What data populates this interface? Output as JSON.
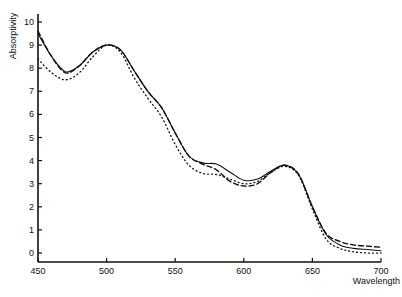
{
  "chart_data": {
    "type": "line",
    "title": "",
    "xlabel": "Wavelength",
    "ylabel": "Absorptivity",
    "xlim": [
      450,
      700
    ],
    "ylim": [
      0,
      10
    ],
    "grid": false,
    "legend": null,
    "x_ticks": [
      450,
      500,
      550,
      600,
      650,
      700
    ],
    "y_ticks": [
      0,
      1,
      2,
      3,
      4,
      5,
      6,
      7,
      8,
      9,
      10
    ],
    "x": [
      450,
      460,
      470,
      480,
      490,
      500,
      510,
      520,
      530,
      540,
      550,
      560,
      570,
      580,
      590,
      600,
      610,
      620,
      630,
      640,
      650,
      660,
      670,
      680,
      690,
      700
    ],
    "series": [
      {
        "name": "solid",
        "style": "solid",
        "values": [
          9.5,
          8.5,
          7.85,
          8.1,
          8.7,
          9.0,
          8.8,
          7.9,
          7.0,
          6.3,
          5.2,
          4.2,
          3.9,
          3.85,
          3.5,
          3.15,
          3.2,
          3.55,
          3.8,
          3.4,
          2.0,
          0.8,
          0.35,
          0.2,
          0.15,
          0.1
        ]
      },
      {
        "name": "dashed",
        "style": "dashed",
        "values": [
          9.6,
          8.5,
          7.8,
          8.1,
          8.7,
          9.0,
          8.8,
          7.9,
          7.0,
          6.3,
          5.2,
          4.2,
          3.85,
          3.6,
          3.1,
          2.9,
          3.0,
          3.5,
          3.8,
          3.4,
          2.0,
          0.85,
          0.5,
          0.35,
          0.3,
          0.25
        ]
      },
      {
        "name": "dotted",
        "style": "dotted",
        "values": [
          8.4,
          7.8,
          7.5,
          7.8,
          8.5,
          9.0,
          8.7,
          7.6,
          6.7,
          5.9,
          4.7,
          3.8,
          3.45,
          3.4,
          3.2,
          3.0,
          3.1,
          3.5,
          3.75,
          3.35,
          1.9,
          0.6,
          0.2,
          0.05,
          0.0,
          0.0
        ]
      }
    ]
  }
}
